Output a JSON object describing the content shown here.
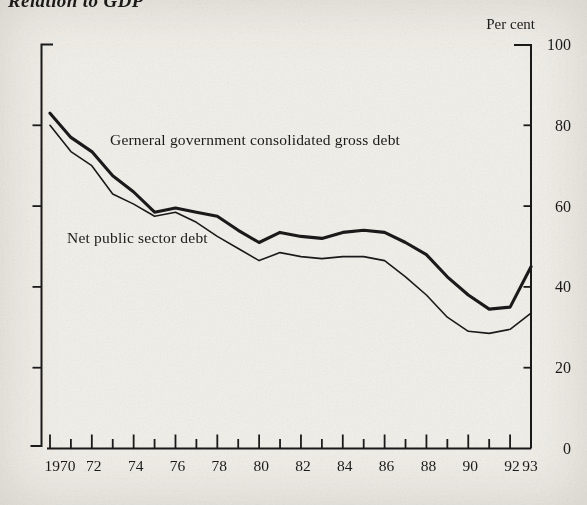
{
  "title": "Relation to GDP",
  "colors": {
    "ink": "#1a1a1a",
    "paper": "#f1efe9"
  },
  "chart_data": {
    "type": "line",
    "title": "Relation to GDP",
    "ylabel": "Per cent",
    "xlabel": "",
    "ylim": [
      0,
      100
    ],
    "grid": false,
    "legend_position": "inline-annotations",
    "y_ticks": [
      0,
      20,
      40,
      60,
      80,
      100
    ],
    "x_tick_labels": [
      "1970",
      "72",
      "74",
      "76",
      "78",
      "80",
      "82",
      "84",
      "86",
      "88",
      "90",
      "92",
      "93"
    ],
    "categories": [
      1970,
      1971,
      1972,
      1973,
      1974,
      1975,
      1976,
      1977,
      1978,
      1979,
      1980,
      1981,
      1982,
      1983,
      1984,
      1985,
      1986,
      1987,
      1988,
      1989,
      1990,
      1991,
      1992,
      1993
    ],
    "series": [
      {
        "name": "Gerneral government consolidated gross debt",
        "style": "thick",
        "values": [
          83,
          77,
          73.5,
          67.5,
          63.5,
          58.5,
          59.5,
          58.5,
          57.5,
          54,
          51,
          53.5,
          52.5,
          52,
          53.5,
          54,
          53.5,
          51,
          48,
          42.5,
          38,
          34.5,
          35,
          45
        ]
      },
      {
        "name": "Net public sector debt",
        "style": "thin",
        "values": [
          80,
          73.5,
          70,
          63,
          60.5,
          57.5,
          58.5,
          56,
          52.5,
          49.5,
          46.5,
          48.5,
          47.5,
          47,
          47.5,
          47.5,
          46.5,
          42.5,
          38,
          32.5,
          29,
          28.5,
          29.5,
          33.5
        ]
      }
    ]
  }
}
